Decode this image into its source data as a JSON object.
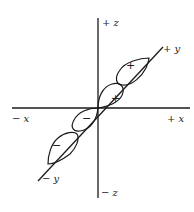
{
  "diagram": {
    "axes": {
      "x_pos": "+ x",
      "x_neg": "− x",
      "y_pos": "+ y",
      "y_neg": "− y",
      "z_pos": "+ z",
      "z_neg": "− z"
    },
    "lobes": [
      {
        "name": "outer-positive",
        "sign": "+"
      },
      {
        "name": "inner-positive",
        "sign": "+"
      },
      {
        "name": "inner-negative",
        "sign": "−"
      },
      {
        "name": "outer-negative",
        "sign": "−"
      }
    ],
    "colors": {
      "line": "#1a1a1a",
      "background": "#ffffff"
    }
  }
}
